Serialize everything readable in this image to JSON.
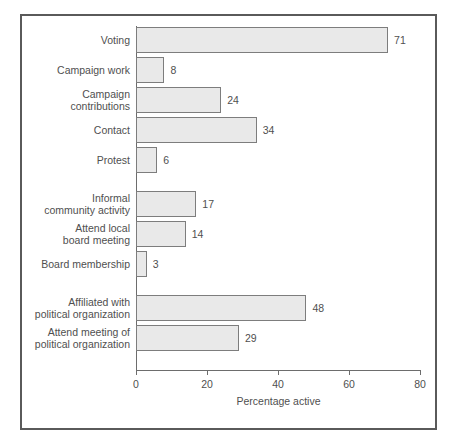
{
  "chart_data": {
    "type": "bar",
    "orientation": "horizontal",
    "title": "",
    "xlabel": "Percentage active",
    "ylabel": "",
    "xlim": [
      0,
      80
    ],
    "xticks": [
      0,
      20,
      40,
      60,
      80
    ],
    "grid": false,
    "legend": null,
    "bar_fill_color": "#e9e9e9",
    "bar_border_color": "#7d7d7d",
    "frame_color": "#5a5a5a",
    "axis_color": "#6d6d6d",
    "text_color": "#4f4f4f",
    "categories": [
      "Voting",
      "Campaign work",
      "Campaign\ncontributions",
      "Contact",
      "Protest",
      "Informal\ncommunity activity",
      "Attend local\nboard meeting",
      "Board membership",
      "Affiliated with\npolitical organization",
      "Attend meeting of\npolitical organization"
    ],
    "values": [
      71,
      8,
      24,
      34,
      6,
      17,
      14,
      3,
      48,
      29
    ],
    "value_labels": [
      "71",
      "8",
      "24",
      "34",
      "6",
      "17",
      "14",
      "3",
      "48",
      "29"
    ],
    "tick_labels": [
      "0",
      "20",
      "40",
      "60",
      "80"
    ],
    "groups": [
      {
        "name": "electoral",
        "category_indices": [
          0,
          1,
          2,
          3,
          4
        ]
      },
      {
        "name": "community",
        "category_indices": [
          5,
          6,
          7
        ]
      },
      {
        "name": "political-organization",
        "category_indices": [
          8,
          9
        ]
      }
    ]
  }
}
